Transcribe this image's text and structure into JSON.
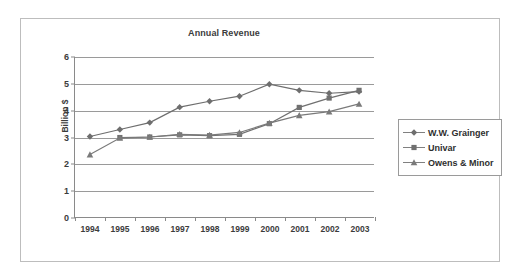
{
  "figure": {
    "background": "#ffffff",
    "frame_color": "#bdbdbd"
  },
  "chart_data": {
    "type": "line",
    "title": "Annual Revenue",
    "xlabel": "",
    "ylabel": "Billion $",
    "categories": [
      "1994",
      "1995",
      "1996",
      "1997",
      "1998",
      "1999",
      "2000",
      "2001",
      "2002",
      "2003"
    ],
    "x": [
      1994,
      1995,
      1996,
      1997,
      1998,
      1999,
      2000,
      2001,
      2002,
      2003
    ],
    "ylim": [
      0,
      6
    ],
    "yticks": [
      0,
      1,
      2,
      3,
      4,
      5,
      6
    ],
    "grid": "horizontal",
    "legend_position": "right",
    "series": [
      {
        "name": "W.W. Grainger",
        "marker": "diamond",
        "color": "#6e6e6e",
        "values": [
          3.02,
          3.28,
          3.54,
          4.12,
          4.34,
          4.53,
          4.98,
          4.75,
          4.64,
          4.7
        ]
      },
      {
        "name": "Univar",
        "marker": "square",
        "color": "#707070",
        "values": [
          null,
          2.98,
          3.0,
          3.08,
          3.05,
          3.1,
          3.5,
          4.11,
          4.46,
          4.75
        ]
      },
      {
        "name": "Owens & Minor",
        "marker": "triangle",
        "color": "#7a7a7a",
        "values": [
          2.34,
          2.96,
          3.0,
          3.1,
          3.07,
          3.17,
          3.52,
          3.81,
          3.95,
          4.24
        ]
      }
    ]
  },
  "axis": {
    "y_tick_labels": [
      "0",
      "1",
      "2",
      "3",
      "4",
      "5",
      "6"
    ],
    "x_tick_labels": [
      "1994",
      "1995",
      "1996",
      "1997",
      "1998",
      "1999",
      "2000",
      "2001",
      "2002",
      "2003"
    ]
  },
  "legend": {
    "entries": [
      {
        "label": "W.W. Grainger",
        "marker": "diamond"
      },
      {
        "label": "Univar",
        "marker": "square"
      },
      {
        "label": "Owens & Minor",
        "marker": "triangle"
      }
    ]
  }
}
